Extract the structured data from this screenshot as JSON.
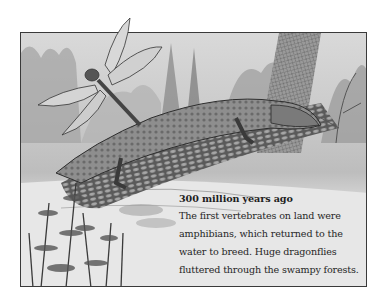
{
  "illustration": {
    "description": "Engraving-style illustration of a Carboniferous swamp: a giant dragonfly hovering above an early amphibian lying on a fallen log beside water, with horsetail plants and ferns",
    "subjects": [
      "giant dragonfly",
      "early amphibian",
      "fallen tree log",
      "swamp water",
      "horsetail plants",
      "ferns",
      "tree trunk",
      "fish"
    ],
    "palette": {
      "light": "#e6e6e6",
      "mid": "#9a9a9a",
      "dark": "#333333",
      "border": "#3a3a3a"
    }
  },
  "caption": {
    "heading": "300 million years ago",
    "lines": [
      "The first vertebrates on land were",
      "amphibians, which returned to the",
      "water to breed. Huge dragonflies",
      "fluttered through the swampy forests."
    ]
  }
}
